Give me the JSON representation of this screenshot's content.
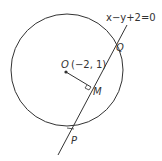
{
  "diagram": {
    "equation": "x−y+2=0",
    "center_label": "O",
    "center_coords": "(−2, 1)",
    "points": {
      "Q": "Q",
      "M": "M",
      "P": "P"
    },
    "colors": {
      "stroke": "#333333",
      "text": "#333333",
      "background": "#ffffff"
    }
  }
}
